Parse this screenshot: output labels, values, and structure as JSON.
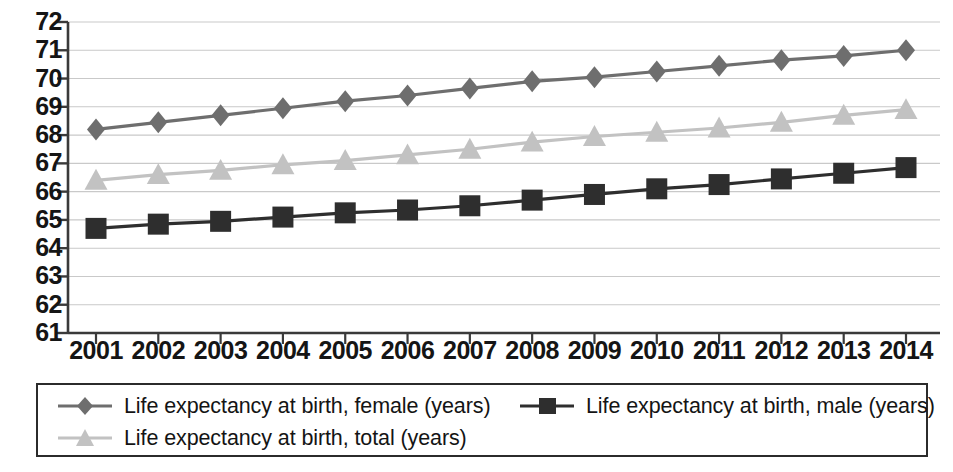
{
  "chart_data": {
    "type": "line",
    "title": "",
    "subtitle": "",
    "xlabel": "",
    "ylabel": "",
    "categories": [
      2001,
      2002,
      2003,
      2004,
      2005,
      2006,
      2007,
      2008,
      2009,
      2010,
      2011,
      2012,
      2013,
      2014
    ],
    "x_tick_labels": [
      "2001",
      "2002",
      "2003",
      "2004",
      "2005",
      "2006",
      "2007",
      "2008",
      "2009",
      "2010",
      "2011",
      "2012",
      "2013",
      "2014"
    ],
    "y_tick_labels": [
      "72",
      "71",
      "70",
      "69",
      "68",
      "67",
      "66",
      "65",
      "64",
      "63",
      "62",
      "61"
    ],
    "y_ticks": [
      72,
      71,
      70,
      69,
      68,
      67,
      66,
      65,
      64,
      63,
      62,
      61
    ],
    "ylim": [
      61,
      72
    ],
    "xlim": [
      2001,
      2014
    ],
    "grid": true,
    "grid_axis": "y",
    "legend_position": "bottom",
    "series": [
      {
        "name": "Life expectancy at birth, female (years)",
        "marker": "diamond",
        "color": "#6e6e6e",
        "values": [
          68.2,
          68.45,
          68.7,
          68.95,
          69.2,
          69.4,
          69.65,
          69.9,
          70.05,
          70.25,
          70.45,
          70.65,
          70.8,
          71.0
        ]
      },
      {
        "name": "Life expectancy at birth, male (years)",
        "marker": "square",
        "color": "#2e2e2e",
        "values": [
          64.7,
          64.85,
          64.95,
          65.1,
          65.25,
          65.35,
          65.5,
          65.7,
          65.9,
          66.1,
          66.25,
          66.45,
          66.65,
          66.85
        ]
      },
      {
        "name": "Life expectancy at birth, total (years)",
        "marker": "triangle",
        "color": "#c2c2c2",
        "values": [
          66.4,
          66.6,
          66.75,
          66.95,
          67.1,
          67.3,
          67.5,
          67.75,
          67.95,
          68.1,
          68.25,
          68.45,
          68.7,
          68.9
        ]
      }
    ]
  },
  "legend": {
    "entries": [
      {
        "label": "Life expectancy at birth, female (years)",
        "marker": "diamond",
        "color": "#6e6e6e"
      },
      {
        "label": "Life expectancy at birth, male (years)",
        "marker": "square",
        "color": "#2e2e2e"
      },
      {
        "label": "Life expectancy at birth, total (years)",
        "marker": "triangle",
        "color": "#c2c2c2"
      }
    ]
  },
  "axes": {
    "axis_color": "#3a3a3a",
    "grid_color": "#c9c9c9",
    "tick_label_color": "#151515"
  }
}
